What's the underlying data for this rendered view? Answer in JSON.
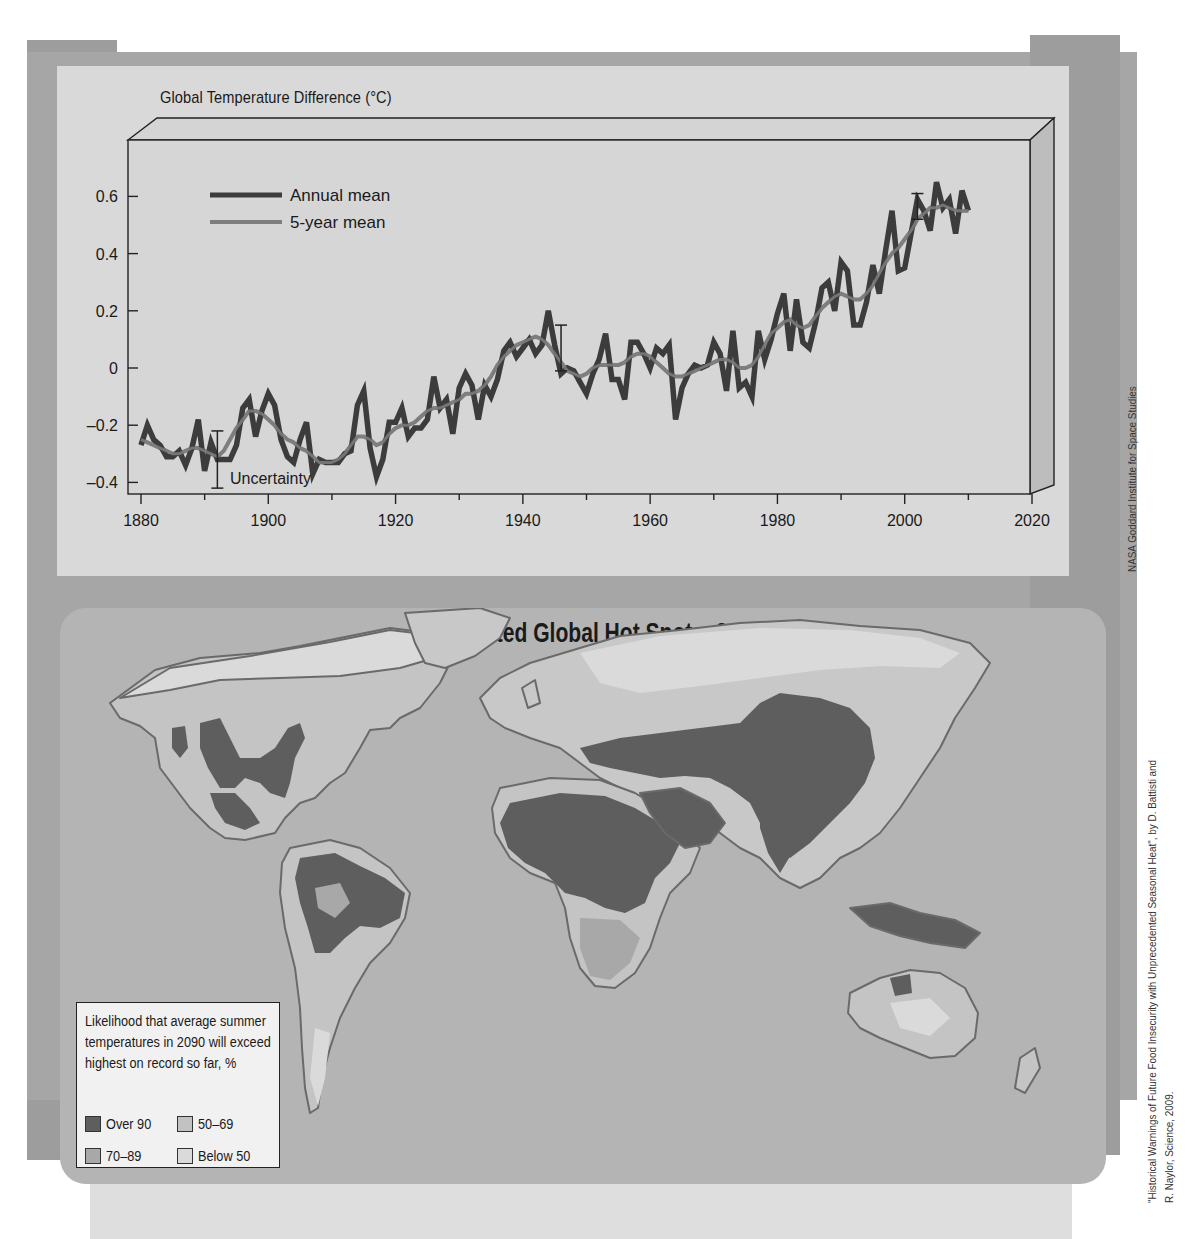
{
  "chart_data": [
    {
      "type": "line",
      "title": "Global Temperature Difference (°C)",
      "xlabel": "",
      "ylabel": "Global Temperature Difference (°C)",
      "xlim": [
        1880,
        2020
      ],
      "ylim": [
        -0.4,
        0.6
      ],
      "x_ticks": [
        1880,
        1900,
        1920,
        1940,
        1960,
        1980,
        2000,
        2020
      ],
      "y_ticks": [
        -0.4,
        -0.2,
        0,
        0.2,
        0.4,
        0.6
      ],
      "y_tick_labels": [
        "-0.4",
        "-0.2",
        "0",
        "0.2",
        "0.4",
        "0.6"
      ],
      "grid": false,
      "legend_position": "upper-left",
      "annotations": [
        {
          "text": "Uncertainty",
          "x": 1892,
          "y": -0.38,
          "type": "error-bar",
          "range": [
            -0.42,
            -0.22
          ]
        },
        {
          "type": "error-bar",
          "x": 1946,
          "range": [
            -0.01,
            0.15
          ]
        },
        {
          "type": "error-bar",
          "x": 2002,
          "range": [
            0.52,
            0.61
          ]
        }
      ],
      "x": [
        1880,
        1881,
        1882,
        1883,
        1884,
        1885,
        1886,
        1887,
        1888,
        1889,
        1890,
        1891,
        1892,
        1893,
        1894,
        1895,
        1896,
        1897,
        1898,
        1899,
        1900,
        1901,
        1902,
        1903,
        1904,
        1905,
        1906,
        1907,
        1908,
        1909,
        1910,
        1911,
        1912,
        1913,
        1914,
        1915,
        1916,
        1917,
        1918,
        1919,
        1920,
        1921,
        1922,
        1923,
        1924,
        1925,
        1926,
        1927,
        1928,
        1929,
        1930,
        1931,
        1932,
        1933,
        1934,
        1935,
        1936,
        1937,
        1938,
        1939,
        1940,
        1941,
        1942,
        1943,
        1944,
        1945,
        1946,
        1947,
        1948,
        1949,
        1950,
        1951,
        1952,
        1953,
        1954,
        1955,
        1956,
        1957,
        1958,
        1959,
        1960,
        1961,
        1962,
        1963,
        1964,
        1965,
        1966,
        1967,
        1968,
        1969,
        1970,
        1971,
        1972,
        1973,
        1974,
        1975,
        1976,
        1977,
        1978,
        1979,
        1980,
        1981,
        1982,
        1983,
        1984,
        1985,
        1986,
        1987,
        1988,
        1989,
        1990,
        1991,
        1992,
        1993,
        1994,
        1995,
        1996,
        1997,
        1998,
        1999,
        2000,
        2001,
        2002,
        2003,
        2004,
        2005,
        2006,
        2007,
        2008,
        2009,
        2010
      ],
      "series": [
        {
          "name": "Annual mean",
          "color": "#3c3c3c",
          "values": [
            -0.27,
            -0.2,
            -0.25,
            -0.27,
            -0.31,
            -0.31,
            -0.29,
            -0.34,
            -0.28,
            -0.18,
            -0.36,
            -0.26,
            -0.32,
            -0.32,
            -0.32,
            -0.27,
            -0.14,
            -0.11,
            -0.24,
            -0.15,
            -0.09,
            -0.13,
            -0.25,
            -0.31,
            -0.33,
            -0.25,
            -0.19,
            -0.37,
            -0.32,
            -0.33,
            -0.33,
            -0.33,
            -0.3,
            -0.29,
            -0.13,
            -0.08,
            -0.28,
            -0.38,
            -0.32,
            -0.19,
            -0.19,
            -0.14,
            -0.24,
            -0.21,
            -0.21,
            -0.18,
            -0.03,
            -0.14,
            -0.11,
            -0.23,
            -0.07,
            -0.02,
            -0.06,
            -0.18,
            -0.06,
            -0.1,
            -0.04,
            0.06,
            0.09,
            0.04,
            0.07,
            0.1,
            0.05,
            0.08,
            0.2,
            0.08,
            -0.02,
            0.0,
            -0.01,
            -0.05,
            -0.09,
            -0.02,
            0.03,
            0.12,
            -0.04,
            -0.04,
            -0.11,
            0.09,
            0.09,
            0.05,
            0.0,
            0.07,
            0.05,
            0.08,
            -0.18,
            -0.07,
            -0.02,
            0.01,
            0.0,
            0.01,
            0.09,
            0.05,
            -0.08,
            0.13,
            -0.07,
            -0.05,
            -0.1,
            0.13,
            0.03,
            0.1,
            0.19,
            0.26,
            0.06,
            0.24,
            0.09,
            0.07,
            0.16,
            0.28,
            0.3,
            0.2,
            0.37,
            0.34,
            0.15,
            0.15,
            0.23,
            0.36,
            0.26,
            0.41,
            0.55,
            0.34,
            0.35,
            0.47,
            0.59,
            0.55,
            0.48,
            0.65,
            0.56,
            0.59,
            0.47,
            0.62,
            0.55
          ]
        },
        {
          "name": "5-year mean",
          "color": "#7e7e7e",
          "values": [
            -0.25,
            -0.26,
            -0.27,
            -0.28,
            -0.29,
            -0.3,
            -0.3,
            -0.29,
            -0.28,
            -0.28,
            -0.29,
            -0.3,
            -0.31,
            -0.29,
            -0.25,
            -0.21,
            -0.18,
            -0.15,
            -0.15,
            -0.16,
            -0.18,
            -0.2,
            -0.23,
            -0.25,
            -0.26,
            -0.28,
            -0.29,
            -0.31,
            -0.33,
            -0.33,
            -0.33,
            -0.32,
            -0.3,
            -0.27,
            -0.24,
            -0.24,
            -0.25,
            -0.27,
            -0.26,
            -0.23,
            -0.21,
            -0.2,
            -0.2,
            -0.19,
            -0.17,
            -0.15,
            -0.14,
            -0.14,
            -0.13,
            -0.12,
            -0.11,
            -0.09,
            -0.09,
            -0.08,
            -0.06,
            -0.03,
            0.01,
            0.04,
            0.06,
            0.08,
            0.09,
            0.1,
            0.11,
            0.1,
            0.08,
            0.05,
            0.02,
            -0.01,
            -0.02,
            -0.03,
            -0.02,
            0.0,
            0.01,
            0.01,
            0.01,
            0.01,
            0.02,
            0.04,
            0.05,
            0.05,
            0.04,
            0.02,
            0.0,
            -0.02,
            -0.03,
            -0.03,
            -0.02,
            -0.01,
            0.0,
            0.01,
            0.02,
            0.03,
            0.03,
            0.02,
            0.0,
            0.0,
            0.01,
            0.04,
            0.08,
            0.12,
            0.14,
            0.16,
            0.17,
            0.15,
            0.14,
            0.15,
            0.18,
            0.21,
            0.23,
            0.25,
            0.26,
            0.25,
            0.24,
            0.24,
            0.26,
            0.29,
            0.33,
            0.37,
            0.4,
            0.42,
            0.45,
            0.48,
            0.52,
            0.54,
            0.56,
            0.56,
            0.57,
            0.56,
            0.55,
            0.55,
            0.55
          ]
        }
      ]
    },
    {
      "type": "heatmap",
      "title": "Projected Global Hot Spots, 2090",
      "subtype": "choropleth-map",
      "legend_title": "Likelihood that average summer temperatures in 2090 will exceed highest on record so far, %",
      "categories": [
        "Over 90",
        "70–89",
        "50–69",
        "Below 50"
      ],
      "category_colors": [
        "#5e5e5e",
        "#a8a8a8",
        "#c2c2c2",
        "#dadada"
      ],
      "regions": {
        "Over 90": [
          "Sahara & most of Africa",
          "Arabian Peninsula",
          "India",
          "China & Central Asia",
          "Southeast Asia",
          "Amazon & eastern Brazil",
          "Mexico & southern USA",
          "eastern USA",
          "Indonesia & New Guinea"
        ],
        "Below 50": [
          "Arctic Canada & Alaska",
          "northern Russia",
          "Greenland",
          "southern South America"
        ]
      }
    }
  ],
  "line_chart": {
    "title": "Global Temperature Difference (°C)",
    "legend": [
      {
        "label": "Annual mean",
        "color": "#3c3c3c"
      },
      {
        "label": "5-year mean",
        "color": "#7e7e7e"
      }
    ],
    "uncertainty_label": "Uncertainty",
    "y_tick_labels": [
      "0.6",
      "0.4",
      "0.2",
      "0",
      "-0.2",
      "-0.4"
    ],
    "x_tick_labels": [
      "1880",
      "1900",
      "1920",
      "1940",
      "1960",
      "1980",
      "2000",
      "2020"
    ]
  },
  "map": {
    "title": "Projected Global Hot Spots, 2090",
    "legend_title": "Likelihood that average summer temperatures in 2090 will exceed highest on record so far, %",
    "legend_items": [
      {
        "label": "Over 90",
        "color": "#5e5e5e"
      },
      {
        "label": "50–69",
        "color": "#c2c2c2"
      },
      {
        "label": "70–89",
        "color": "#a8a8a8"
      },
      {
        "label": "Below 50",
        "color": "#dadada"
      }
    ]
  },
  "credits": {
    "chart_source": "NASA Goddard Institute for Space Studies",
    "map_source_line1": "\"Historical Warnings of Future Food Insecurity with Unprecedented Seasonal Heat\", by D. Battisti and",
    "map_source_line2": "R. Naylor, Science, 2009."
  },
  "colors": {
    "frame": "#9d9d9d",
    "panel": "#d9d9d9",
    "map_ocean": "#b4b4b4",
    "annual_line": "#3c3c3c",
    "five_year_line": "#7e7e7e"
  }
}
